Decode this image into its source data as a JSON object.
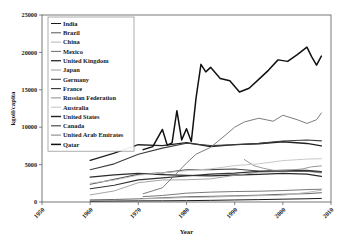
{
  "chart_data": {
    "type": "line",
    "title": "",
    "xlabel": "Year",
    "ylabel": "kgoil/capita",
    "xlim": [
      1950,
      2010
    ],
    "ylim": [
      0,
      25000
    ],
    "xticks": [
      1950,
      1960,
      1970,
      1980,
      1990,
      2000,
      2010
    ],
    "yticks": [
      0,
      5000,
      10000,
      15000,
      20000,
      25000
    ],
    "xtick_labels": [
      "1950",
      "1960",
      "1970",
      "1980",
      "1990",
      "2000",
      "2010"
    ],
    "ytick_labels": [
      "0",
      "5000",
      "10000",
      "15000",
      "20000",
      "25000"
    ],
    "grid": false,
    "legend_position": "upper-left",
    "series": [
      {
        "name": "India",
        "color": "#1a1a1a",
        "width": 1.0,
        "x": [
          1960,
          1965,
          1970,
          1975,
          1980,
          1985,
          1990,
          1995,
          2000,
          2005,
          2008
        ],
        "values": [
          110,
          130,
          150,
          160,
          180,
          220,
          270,
          320,
          380,
          430,
          480
        ]
      },
      {
        "name": "Brazil",
        "color": "#555555",
        "width": 0.9,
        "x": [
          1960,
          1965,
          1970,
          1975,
          1980,
          1985,
          1990,
          1995,
          2000,
          2005,
          2008
        ],
        "values": [
          280,
          340,
          420,
          560,
          700,
          760,
          830,
          910,
          1040,
          1110,
          1240
        ]
      },
      {
        "name": "China",
        "color": "#b5b5b5",
        "width": 0.9,
        "x": [
          1971,
          1975,
          1980,
          1985,
          1990,
          1995,
          2000,
          2005,
          2008
        ],
        "values": [
          430,
          480,
          600,
          640,
          760,
          840,
          900,
          1280,
          1570
        ]
      },
      {
        "name": "Mexico",
        "color": "#6b6b6b",
        "width": 0.9,
        "x": [
          1971,
          1975,
          1980,
          1985,
          1990,
          1995,
          2000,
          2005,
          2008
        ],
        "values": [
          720,
          870,
          1180,
          1320,
          1400,
          1440,
          1530,
          1660,
          1710
        ]
      },
      {
        "name": "United Kingdom",
        "color": "#2a2a2a",
        "width": 1.3,
        "x": [
          1960,
          1965,
          1970,
          1975,
          1980,
          1985,
          1990,
          1995,
          2000,
          2005,
          2008
        ],
        "values": [
          3320,
          3620,
          3840,
          3670,
          3560,
          3490,
          3610,
          3700,
          3830,
          3730,
          3420
        ]
      },
      {
        "name": "Japan",
        "color": "#9c9c9c",
        "width": 0.9,
        "x": [
          1960,
          1965,
          1970,
          1975,
          1980,
          1985,
          1990,
          1995,
          2000,
          2005,
          2008
        ],
        "values": [
          950,
          1480,
          2580,
          2940,
          2970,
          3090,
          3560,
          3970,
          4090,
          4080,
          3880
        ]
      },
      {
        "name": "Germany",
        "color": "#4a4a4a",
        "width": 1.1,
        "x": [
          1960,
          1965,
          1970,
          1975,
          1980,
          1985,
          1990,
          1995,
          2000,
          2005,
          2008
        ],
        "values": [
          2380,
          3030,
          3690,
          3890,
          4320,
          4330,
          4420,
          4150,
          4110,
          4150,
          4000
        ]
      },
      {
        "name": "France",
        "color": "#333333",
        "width": 1.1,
        "x": [
          1960,
          1965,
          1970,
          1975,
          1980,
          1985,
          1990,
          1995,
          2000,
          2005,
          2008
        ],
        "values": [
          1780,
          2230,
          2960,
          3230,
          3480,
          3720,
          3860,
          4090,
          4230,
          4250,
          4070
        ]
      },
      {
        "name": "Russian Federation",
        "color": "#8c8c8c",
        "width": 0.9,
        "x": [
          1992,
          1994,
          1996,
          1998,
          2000,
          2002,
          2004,
          2006,
          2008
        ],
        "values": [
          5680,
          4860,
          4500,
          4240,
          4220,
          4310,
          4410,
          4710,
          4830
        ]
      },
      {
        "name": "Australia",
        "color": "#c2c2c2",
        "width": 0.9,
        "x": [
          1960,
          1965,
          1970,
          1975,
          1980,
          1985,
          1990,
          1995,
          2000,
          2005,
          2008
        ],
        "values": [
          2500,
          2940,
          3580,
          3900,
          4180,
          4430,
          4860,
          5100,
          5530,
          5740,
          5780
        ]
      },
      {
        "name": "United States",
        "color": "#222222",
        "width": 1.4,
        "x": [
          1960,
          1965,
          1970,
          1975,
          1980,
          1985,
          1990,
          1995,
          2000,
          2005,
          2008
        ],
        "values": [
          5560,
          6530,
          7660,
          7540,
          7930,
          7420,
          7670,
          7780,
          8050,
          7830,
          7500
        ]
      },
      {
        "name": "Canada",
        "color": "#3d3d3d",
        "width": 1.1,
        "x": [
          1960,
          1965,
          1970,
          1975,
          1980,
          1985,
          1990,
          1995,
          2000,
          2005,
          2008
        ],
        "values": [
          4320,
          5100,
          6380,
          7200,
          7850,
          7550,
          7650,
          7840,
          8160,
          8280,
          8170
        ]
      },
      {
        "name": "United Arab Emirates",
        "color": "#7d7d7d",
        "width": 1.0,
        "x": [
          1971,
          1975,
          1980,
          1982,
          1985,
          1988,
          1990,
          1992,
          1995,
          1998,
          2000,
          2003,
          2005,
          2007,
          2008
        ],
        "values": [
          1100,
          1900,
          5200,
          6400,
          7300,
          8900,
          10000,
          10700,
          11200,
          10800,
          11600,
          11000,
          10500,
          11000,
          11900
        ]
      },
      {
        "name": "Qatar",
        "color": "#111111",
        "width": 1.5,
        "x": [
          1971,
          1973,
          1975,
          1976,
          1977,
          1978,
          1979,
          1980,
          1981,
          1982,
          1983,
          1984,
          1985,
          1987,
          1989,
          1991,
          1993,
          1995,
          1997,
          1999,
          2001,
          2003,
          2005,
          2006,
          2007,
          2008
        ],
        "values": [
          7000,
          7400,
          9700,
          7600,
          7900,
          12200,
          8300,
          9800,
          8100,
          14000,
          18400,
          17400,
          18000,
          16500,
          16200,
          14700,
          15200,
          16400,
          17600,
          19000,
          18800,
          19700,
          20700,
          19400,
          18300,
          19500
        ]
      }
    ]
  },
  "axes": {
    "y_title": "kgoil/capita",
    "x_title": "Year"
  },
  "legend": {
    "items": [
      {
        "label": "India"
      },
      {
        "label": "Brazil"
      },
      {
        "label": "China"
      },
      {
        "label": "Mexico"
      },
      {
        "label": "United Kingdom"
      },
      {
        "label": "Japan"
      },
      {
        "label": "Germany"
      },
      {
        "label": "France"
      },
      {
        "label": "Russian Federation"
      },
      {
        "label": "Australia"
      },
      {
        "label": "United States"
      },
      {
        "label": "Canada"
      },
      {
        "label": "United Arab Emirates"
      },
      {
        "label": "Qatar"
      }
    ]
  }
}
